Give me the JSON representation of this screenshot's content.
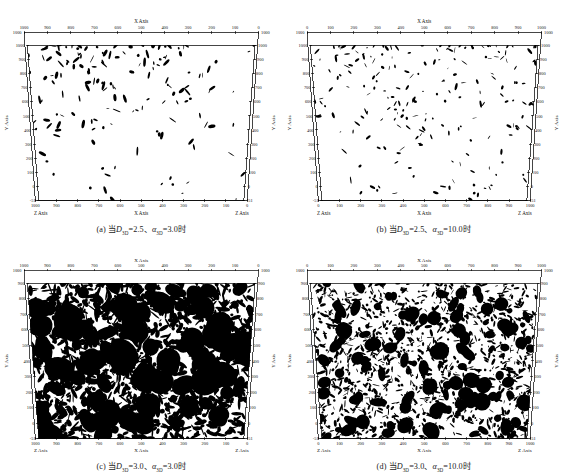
{
  "figure": {
    "panel_count": 4,
    "background": "#ffffff",
    "ink": "#000000"
  },
  "panels": [
    {
      "id": "a",
      "caption_prefix": "(a)",
      "caption_cn": "当",
      "caption_var1": "D",
      "caption_var1_sub": "3D",
      "caption_val1": "=2.5",
      "caption_sep": "、",
      "caption_var2": "α",
      "caption_var2_sub": "3D",
      "caption_val2": "=3.0",
      "caption_suffix": "时",
      "caption_full": "(a) 当D3D=2.5、α3D=3.0时",
      "x_direction": "descending",
      "x_ticks": [
        "1000",
        "900",
        "800",
        "700",
        "600",
        "500",
        "400",
        "300",
        "200",
        "100",
        "0"
      ],
      "y_ticks": [
        "1000",
        "900",
        "800",
        "700",
        "600",
        "500",
        "400",
        "300",
        "200",
        "100",
        "0",
        "-51"
      ],
      "corner_top_left": "1000",
      "corner_top_right": "1000",
      "corner_bottom_left": "-51",
      "corner_bottom_right": "-51",
      "label_top": "X Axis",
      "label_bottom": "X Axis",
      "label_left": "Y Axis",
      "label_right": "Y Axis",
      "label_corner_bl": "Z Axis",
      "label_corner_br": "Z Axis",
      "density": 0.06,
      "seed": 11,
      "blob_scale": 1.0,
      "cluster_bias": "upper-left"
    },
    {
      "id": "b",
      "caption_prefix": "(b)",
      "caption_cn": "当",
      "caption_var1": "D",
      "caption_var1_sub": "3D",
      "caption_val1": "=2.5",
      "caption_sep": "、",
      "caption_var2": "α",
      "caption_var2_sub": "3D",
      "caption_val2": "=10.0",
      "caption_suffix": "时",
      "caption_full": "(b) 当D3D=2.5、α3D=10.0时",
      "x_direction": "ascending",
      "x_ticks": [
        "0",
        "100",
        "200",
        "300",
        "400",
        "500",
        "600",
        "700",
        "800",
        "900",
        "1000"
      ],
      "y_ticks": [
        "1000",
        "900",
        "800",
        "700",
        "600",
        "500",
        "400",
        "300",
        "200",
        "100",
        "0",
        "-51"
      ],
      "corner_top_left": "1000",
      "corner_top_right": "1000",
      "corner_bottom_left": "-51",
      "corner_bottom_right": "-51",
      "label_top": "X Axis",
      "label_bottom": "X Axis",
      "label_left": "Y Axis",
      "label_right": "Y Axis",
      "label_corner_bl": "Z Axis",
      "label_corner_br": "Z Axis",
      "density": 0.08,
      "seed": 23,
      "blob_scale": 0.8,
      "cluster_bias": "upper"
    },
    {
      "id": "c",
      "caption_prefix": "(c)",
      "caption_cn": "当",
      "caption_var1": "D",
      "caption_var1_sub": "3D",
      "caption_val1": "=3.0",
      "caption_sep": "、",
      "caption_var2": "α",
      "caption_var2_sub": "3D",
      "caption_val2": "=3.0",
      "caption_suffix": "时",
      "caption_full": "(c) 当D3D=3.0、α3D=3.0时",
      "x_direction": "descending",
      "x_ticks": [
        "1000",
        "900",
        "800",
        "700",
        "600",
        "500",
        "400",
        "300",
        "200",
        "100",
        "0"
      ],
      "y_ticks": [
        "900",
        "800",
        "700",
        "600",
        "500",
        "400",
        "300",
        "200",
        "100",
        "0",
        "-51"
      ],
      "corner_top_left": "1000",
      "corner_top_right": "1000",
      "corner_bottom_left": "-51",
      "corner_bottom_right": "-51",
      "label_top": "X Axis",
      "label_bottom": "X Axis",
      "label_left": "Y Axis",
      "label_right": "Y Axis",
      "label_corner_bl": "Z Axis",
      "label_corner_br": "Z Axis",
      "density": 0.52,
      "seed": 37,
      "blob_scale": 1.5,
      "cluster_bias": "uniform"
    },
    {
      "id": "d",
      "caption_prefix": "(d)",
      "caption_cn": "当",
      "caption_var1": "D",
      "caption_var1_sub": "3D",
      "caption_val1": "=3.0",
      "caption_sep": "、",
      "caption_var2": "α",
      "caption_var2_sub": "3D",
      "caption_val2": "=10.0",
      "caption_suffix": "时",
      "caption_full": "(d) 当D3D=3.0、α3D=10.0时",
      "x_direction": "ascending",
      "x_ticks": [
        "0",
        "100",
        "200",
        "300",
        "400",
        "500",
        "600",
        "700",
        "800",
        "900",
        "1000"
      ],
      "y_ticks": [
        "900",
        "800",
        "700",
        "600",
        "500",
        "400",
        "300",
        "200",
        "100",
        "0",
        "-51"
      ],
      "corner_top_left": "1000",
      "corner_top_right": "1000",
      "corner_bottom_left": "-51",
      "corner_bottom_right": "-51",
      "label_top": "X Axis",
      "label_bottom": "X Axis",
      "label_left": "Y Axis",
      "label_right": "Y Axis",
      "label_corner_bl": "Z Axis",
      "label_corner_br": "Z Axis",
      "density": 0.5,
      "seed": 59,
      "blob_scale": 0.9,
      "cluster_bias": "uniform"
    }
  ],
  "chart_data": {
    "type": "scatter",
    "title": "",
    "xlabel": "X Axis",
    "ylabel": "Y Axis",
    "zlabel": "Z Axis",
    "xlim": [
      0,
      1000
    ],
    "ylim": [
      -51,
      1000
    ],
    "grid": false,
    "legend": "none",
    "projection": "3D perspective box (trapezoid)",
    "marker_color": "#000000",
    "subplots": [
      {
        "label": "(a)",
        "params": {
          "D_3D": 2.5,
          "alpha_3D": 3.0
        },
        "fracture_area_fraction": 0.06,
        "description": "Sparse elongated fracture traces, clustered in upper-left quadrant"
      },
      {
        "label": "(b)",
        "params": {
          "D_3D": 2.5,
          "alpha_3D": 10.0
        },
        "fracture_area_fraction": 0.08,
        "description": "Many small scattered fracture traces concentrated in upper half"
      },
      {
        "label": "(c)",
        "params": {
          "D_3D": 3.0,
          "alpha_3D": 3.0
        },
        "fracture_area_fraction": 0.52,
        "description": "Dense large coalesced fracture clusters filling the domain"
      },
      {
        "label": "(d)",
        "params": {
          "D_3D": 3.0,
          "alpha_3D": 10.0
        },
        "fracture_area_fraction": 0.5,
        "description": "Dense fine-grained fracture network uniformly filling the domain"
      }
    ]
  }
}
